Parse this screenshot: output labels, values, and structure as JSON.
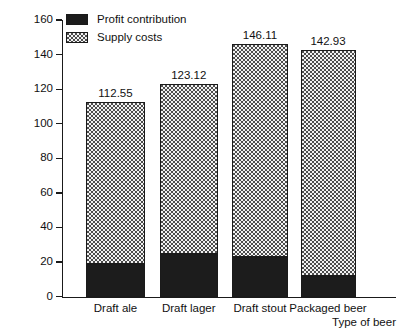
{
  "chart_data": {
    "type": "bar",
    "subtype": "stacked-vertical",
    "title": "",
    "xlabel": "Type of beer",
    "ylabel": "Pounds per bbl",
    "ylim": [
      0,
      160
    ],
    "yticks": [
      0,
      20,
      40,
      60,
      80,
      100,
      120,
      140,
      160
    ],
    "grid": false,
    "legend_position": "top-left",
    "categories": [
      "Draft ale",
      "Draft lager",
      "Draft stout",
      "Packaged beer"
    ],
    "series": [
      {
        "name": "Profit contribution",
        "swatch": "solid-black",
        "color": "#1c1c1c",
        "values": [
          19.0,
          24.5,
          23.0,
          12.0
        ]
      },
      {
        "name": "Supply costs",
        "swatch": "stipple",
        "color": "#f2f2f2",
        "values": [
          93.55,
          98.62,
          123.11,
          130.93
        ]
      }
    ],
    "totals": [
      112.55,
      123.12,
      146.11,
      142.93
    ],
    "total_labels": [
      "112.55",
      "123.12",
      "146.11",
      "142.93"
    ]
  },
  "axes": {
    "y_title": "Pounds per bbl",
    "x_title": "Type of beer",
    "y_tick_labels": [
      "160",
      "140",
      "120",
      "100",
      "80",
      "60",
      "40",
      "20",
      "0"
    ]
  },
  "legend": {
    "items": [
      {
        "label": "Profit contribution"
      },
      {
        "label": "Supply costs"
      }
    ]
  },
  "colors": {
    "ink": "#1a1a1a",
    "profit": "#1c1c1c",
    "supply_fill": "#f2f2f2",
    "supply_dot": "#4d4d4d",
    "background": "#ffffff"
  }
}
